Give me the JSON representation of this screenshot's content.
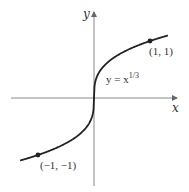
{
  "chart_data": {
    "type": "line",
    "title": "",
    "xlabel": "x",
    "ylabel": "y",
    "xlim": [
      -1.4,
      1.45
    ],
    "ylim": [
      -1.55,
      1.5
    ],
    "grid": false,
    "legend": null,
    "series": [
      {
        "name": "y = x^(1/3)",
        "function": "cbrt",
        "x": [
          -1.3,
          -1.0,
          -0.6,
          -0.3,
          -0.1,
          -0.02,
          0,
          0.02,
          0.1,
          0.3,
          0.6,
          1.0,
          1.3
        ],
        "y": [
          -1.091,
          -1.0,
          -0.843,
          -0.669,
          -0.464,
          -0.271,
          0,
          0.271,
          0.464,
          0.669,
          0.843,
          1.0,
          1.091
        ]
      }
    ],
    "points": [
      {
        "x": 1,
        "y": 1,
        "label": "(1, 1)"
      },
      {
        "x": -1,
        "y": -1,
        "label": "(−1, −1)"
      }
    ],
    "annotations": [
      {
        "text": "y = x",
        "superscript": "1/3"
      }
    ]
  },
  "labels": {
    "x_axis": "x",
    "y_axis": "y",
    "function_main": "y = x",
    "function_exp": "1/3",
    "point_pos": "(1, 1)",
    "point_neg": "(−1, −1)"
  },
  "colors": {
    "axis": "#888888",
    "curve": "#222222",
    "text": "#333333"
  }
}
